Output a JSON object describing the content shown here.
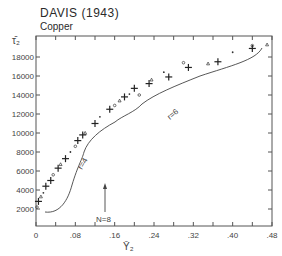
{
  "header": {
    "title": "DAVIS (1943)",
    "subtitle": "Copper"
  },
  "axes": {
    "ylabel": "τ̄₂",
    "xlabel": "Ȳ₂",
    "yticks": [
      "2000",
      "4000",
      "6000",
      "8000",
      "10000",
      "12000",
      "14000",
      "16000",
      "18000"
    ],
    "xticks": [
      "0",
      ".08",
      ".16",
      ".24",
      ".32",
      ".40",
      ".48"
    ]
  },
  "annotations": {
    "r4": "r=4",
    "r6": "r=6",
    "n8": "N=8"
  },
  "chart_data": {
    "type": "scatter",
    "title": "DAVIS (1943)",
    "subtitle": "Copper",
    "xlabel": "Ȳ₂",
    "ylabel": "τ̄₂",
    "xlim": [
      0,
      0.48
    ],
    "ylim": [
      0,
      19500
    ],
    "x_ticks": [
      0,
      0.08,
      0.16,
      0.24,
      0.32,
      0.4,
      0.48
    ],
    "y_ticks": [
      2000,
      4000,
      6000,
      8000,
      10000,
      12000,
      14000,
      16000,
      18000
    ],
    "grid": false,
    "legend": "none",
    "series": [
      {
        "name": "experimental (+ markers)",
        "marker": "+",
        "points": [
          [
            0.005,
            2800
          ],
          [
            0.02,
            4400
          ],
          [
            0.03,
            5000
          ],
          [
            0.045,
            6300
          ],
          [
            0.06,
            7300
          ],
          [
            0.085,
            9200
          ],
          [
            0.095,
            9800
          ],
          [
            0.12,
            11000
          ],
          [
            0.15,
            12500
          ],
          [
            0.18,
            13800
          ],
          [
            0.2,
            14700
          ],
          [
            0.23,
            15200
          ],
          [
            0.27,
            15900
          ],
          [
            0.31,
            16900
          ],
          [
            0.37,
            17500
          ],
          [
            0.44,
            18900
          ]
        ]
      },
      {
        "name": "experimental (small symbols)",
        "marker": "o / △ / ▽ / •",
        "points": [
          [
            0.002,
            2200
          ],
          [
            0.01,
            3300
          ],
          [
            0.015,
            3700
          ],
          [
            0.035,
            5600
          ],
          [
            0.05,
            6700
          ],
          [
            0.07,
            8000
          ],
          [
            0.08,
            8600
          ],
          [
            0.1,
            10000
          ],
          [
            0.13,
            11700
          ],
          [
            0.16,
            12900
          ],
          [
            0.17,
            13400
          ],
          [
            0.19,
            14100
          ],
          [
            0.21,
            14000
          ],
          [
            0.235,
            15600
          ],
          [
            0.26,
            16400
          ],
          [
            0.3,
            17400
          ],
          [
            0.35,
            17300
          ],
          [
            0.4,
            18500
          ],
          [
            0.44,
            19200
          ],
          [
            0.47,
            19300
          ]
        ]
      }
    ],
    "annotations": [
      {
        "text": "r=4",
        "x": 0.1,
        "y": 6000
      },
      {
        "text": "r=6",
        "x": 0.27,
        "y": 11600
      },
      {
        "text": "N=8",
        "x": 0.145,
        "y": 800,
        "arrow_up_to_y": 5000
      }
    ]
  }
}
